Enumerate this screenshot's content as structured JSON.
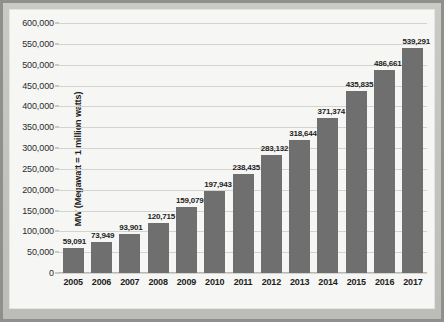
{
  "chart_data": {
    "type": "bar",
    "title": "",
    "subtitle": "",
    "xlabel": "",
    "ylabel": "MW (Megawatt = 1 million watts)",
    "categories": [
      "2005",
      "2006",
      "2007",
      "2008",
      "2009",
      "2010",
      "2011",
      "2012",
      "2013",
      "2014",
      "2015",
      "2016",
      "2017"
    ],
    "values": [
      59091,
      73949,
      93901,
      120715,
      159079,
      197943,
      238435,
      283132,
      318644,
      371374,
      435835,
      486661,
      539291
    ],
    "value_labels": [
      "59,091",
      "73,949",
      "93,901",
      "120,715",
      "159,079",
      "197,943",
      "238,435",
      "283,132",
      "318,644",
      "371,374",
      "435,835",
      "486,661",
      "539,291"
    ],
    "ylim": [
      0,
      600000
    ],
    "ytick_values": [
      0,
      50000,
      100000,
      150000,
      200000,
      250000,
      300000,
      350000,
      400000,
      450000,
      500000,
      550000,
      600000
    ],
    "ytick_labels": [
      "0",
      "50,000",
      "100,000",
      "150,000",
      "200,000",
      "250,000",
      "300,000",
      "350,000",
      "400,000",
      "450,000",
      "500,000",
      "550,000",
      "600,000"
    ],
    "grid": true,
    "legend": false,
    "legend_position": "none",
    "series": [
      {
        "name": "Installed capacity",
        "values": [
          59091,
          73949,
          93901,
          120715,
          159079,
          197943,
          238435,
          283132,
          318644,
          371374,
          435835,
          486661,
          539291
        ]
      }
    ]
  },
  "colors": {
    "bar": "#6f6f6f",
    "gridline": "#d3d3cf",
    "plot_background": "#f6f6f4",
    "frame": "#8f8f8b",
    "text": "#1d1d1d"
  }
}
